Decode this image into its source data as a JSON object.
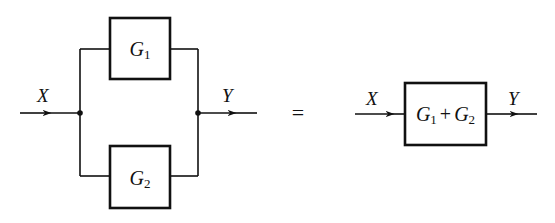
{
  "diagram": {
    "type": "block-diagram-parallel-equivalence",
    "left": {
      "input_label": "X",
      "output_label": "Y",
      "blocks": [
        {
          "symbol": "G",
          "subscript": "1"
        },
        {
          "symbol": "G",
          "subscript": "2"
        }
      ]
    },
    "equals_sign": "=",
    "right": {
      "input_label": "X",
      "output_label": "Y",
      "block": {
        "term1": {
          "symbol": "G",
          "subscript": "1"
        },
        "operator": "+",
        "term2": {
          "symbol": "G",
          "subscript": "2"
        }
      }
    },
    "colors": {
      "stroke": "#111111",
      "background": "#ffffff"
    }
  }
}
